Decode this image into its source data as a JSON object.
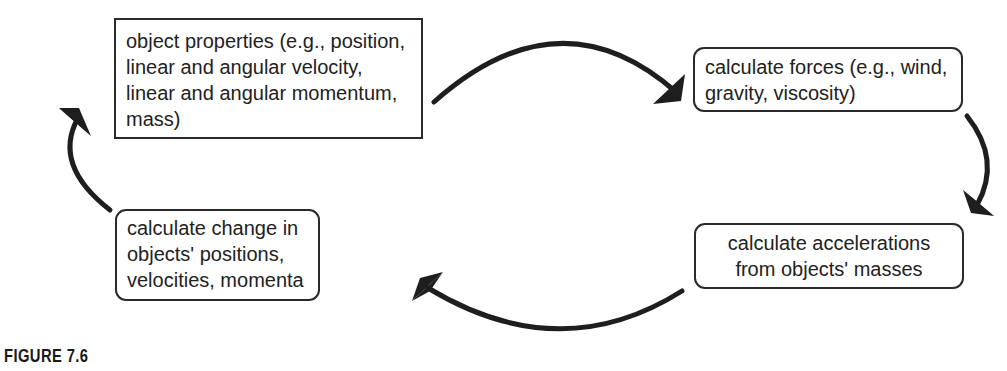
{
  "diagram": {
    "type": "cycle",
    "nodes": [
      {
        "id": "properties",
        "shape": "rectangle",
        "lines": [
          "object properties (e.g., position,",
          "linear and angular velocity,",
          "linear and angular momentum,",
          "mass)"
        ]
      },
      {
        "id": "forces",
        "shape": "rounded-rectangle",
        "lines": [
          "calculate forces (e.g., wind,",
          "gravity, viscosity)"
        ]
      },
      {
        "id": "accelerations",
        "shape": "rounded-rectangle",
        "lines": [
          "calculate accelerations",
          "from objects' masses"
        ]
      },
      {
        "id": "change",
        "shape": "rounded-rectangle",
        "lines": [
          "calculate change in",
          "objects' positions,",
          "velocities, momenta"
        ]
      }
    ],
    "edges": [
      {
        "from": "properties",
        "to": "forces"
      },
      {
        "from": "forces",
        "to": "accelerations"
      },
      {
        "from": "accelerations",
        "to": "change"
      },
      {
        "from": "change",
        "to": "properties"
      }
    ],
    "colors": {
      "stroke": "#2a2a2a",
      "arrow": "#1e1e1e",
      "background": "#ffffff"
    }
  },
  "caption": {
    "label": "FIGURE 7.6"
  }
}
